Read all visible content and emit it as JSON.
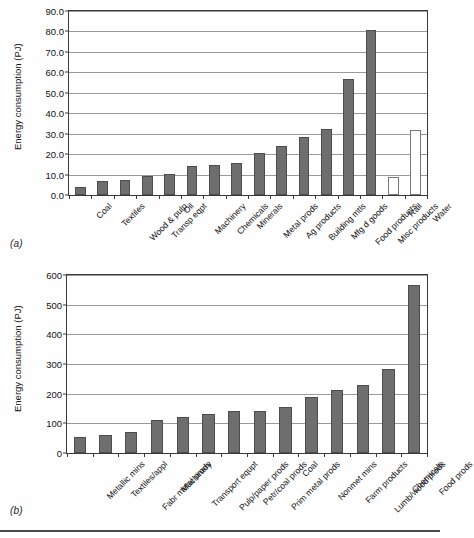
{
  "figure": {
    "panels": [
      {
        "id": "a",
        "label": "(a)"
      },
      {
        "id": "b",
        "label": "(b)"
      }
    ]
  },
  "chart_data": [
    {
      "type": "bar",
      "panel": "(a)",
      "title": "",
      "xlabel": "",
      "ylabel": "Energy consumption (PJ)",
      "ylim": [
        0.0,
        90.0
      ],
      "yticks": [
        "0.0",
        "10.0",
        "20.0",
        "30.0",
        "40.0",
        "50.0",
        "60.0",
        "70.0",
        "80.0",
        "90.0"
      ],
      "ytick_values": [
        0,
        10,
        20,
        30,
        40,
        50,
        60,
        70,
        80,
        90
      ],
      "grid": true,
      "legend": "none",
      "categories": [
        "Coal",
        "Textiles",
        "Wood & pulp",
        "Transp eqpt",
        "Oil",
        "Machinery",
        "Chemicals",
        "Minerals",
        "Metal prods",
        "Ag products",
        "Building mtls",
        "Mfg d goods",
        "Food products",
        "Misc products",
        "Rail",
        "Water"
      ],
      "values": [
        4.1,
        7.1,
        7.2,
        9.3,
        10.3,
        14.3,
        14.8,
        15.5,
        20.6,
        24.2,
        28.5,
        32.5,
        56.7,
        80.7,
        8.8,
        32.0
      ],
      "bar_styles": [
        "filled",
        "filled",
        "filled",
        "filled",
        "filled",
        "filled",
        "filled",
        "filled",
        "filled",
        "filled",
        "filled",
        "filled",
        "filled",
        "filled",
        "open",
        "open"
      ]
    },
    {
      "type": "bar",
      "panel": "(b)",
      "title": "",
      "xlabel": "",
      "ylabel": "Energy consumption (PJ)",
      "ylim": [
        0,
        600
      ],
      "yticks": [
        "0",
        "100",
        "200",
        "300",
        "400",
        "500",
        "600"
      ],
      "ytick_values": [
        0,
        100,
        200,
        300,
        400,
        500,
        600
      ],
      "grid": true,
      "legend": "none",
      "categories": [
        "Metallic mins",
        "Textiles/appl",
        "Fabr metal prods",
        "Machinery",
        "Transport equpt",
        "Pulp/paper prods",
        "Petr/coal prods",
        "Prim metal prods",
        "Coal",
        "Nonmet mins",
        "Farm products",
        "Lumb/wood prods",
        "Chemicals",
        "Food prods"
      ],
      "values": [
        55,
        61,
        71,
        110,
        122,
        132,
        142,
        143,
        154,
        189,
        212,
        228,
        284,
        565
      ],
      "bar_styles": [
        "filled",
        "filled",
        "filled",
        "filled",
        "filled",
        "filled",
        "filled",
        "filled",
        "filled",
        "filled",
        "filled",
        "filled",
        "filled",
        "filled"
      ]
    }
  ],
  "colors": {
    "bar_fill": "#6e6e6e",
    "bar_stroke": "#4d4d4d",
    "open_bar_fill": "#ffffff",
    "axis": "#3a3a3a",
    "grid": "#9a9a9a",
    "background": "#ffffff"
  }
}
